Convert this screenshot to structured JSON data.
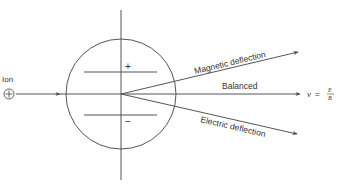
{
  "diagram": {
    "colors": {
      "line": "#444444",
      "text": "#333333",
      "background": "#ffffff"
    },
    "ion": {
      "label": "Ion",
      "symbol": "+"
    },
    "plates": {
      "top_sign": "+",
      "bottom_sign": "−"
    },
    "paths": [
      {
        "id": "magnetic",
        "label": "Magnetic deflection"
      },
      {
        "id": "balanced",
        "label": "Balanced"
      },
      {
        "id": "electric",
        "label": "Electric deflection"
      }
    ],
    "formula": {
      "lhs": "v",
      "eq": "=",
      "numerator": "E",
      "denominator": "B"
    }
  }
}
